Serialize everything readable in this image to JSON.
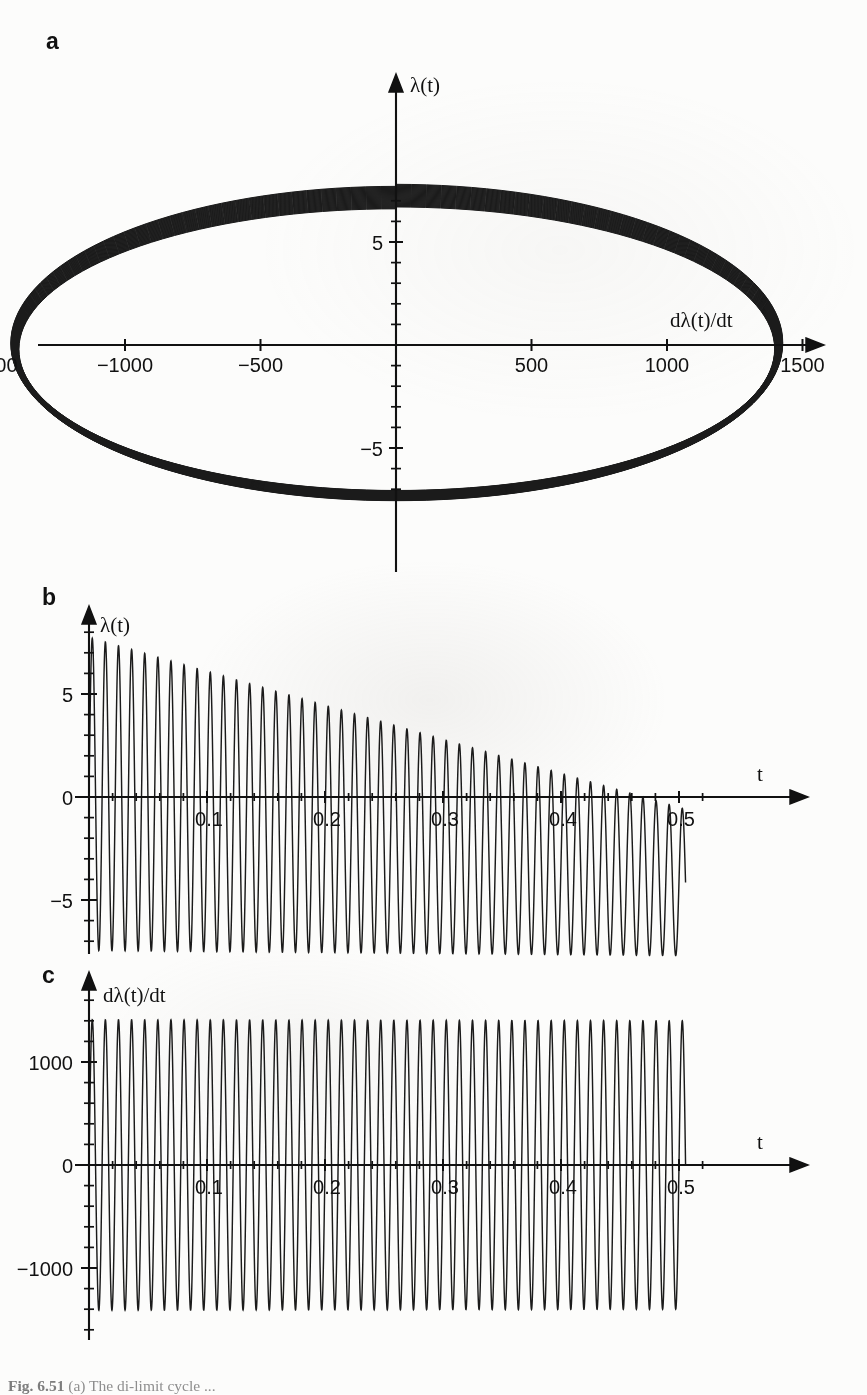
{
  "figure": {
    "caption_prefix": "Fig. 6.51",
    "caption_text": "(a) The di-limit cycle ..."
  },
  "panels": {
    "a": {
      "letter": "a",
      "yaxis_label": "λ(t)",
      "xaxis_label": "dλ(t)/dt",
      "x_ticklabels": [
        "−1500",
        "−1000",
        "−500",
        "500",
        "1000",
        "1500"
      ],
      "x_tickvalues": [
        -1500,
        -1000,
        -500,
        500,
        1000,
        1500
      ],
      "y_ticklabels": [
        "5",
        "−5"
      ],
      "y_tickvalues": [
        5,
        -5
      ]
    },
    "b": {
      "letter": "b",
      "yaxis_label": "λ(t)",
      "xaxis_label": "t",
      "x_ticklabels": [
        "0.1",
        "0.2",
        "0.3",
        "0.4",
        "0.5"
      ],
      "x_tickvalues": [
        0.1,
        0.2,
        0.3,
        0.4,
        0.5
      ],
      "y_ticklabels": [
        "5",
        "0",
        "−5"
      ],
      "y_tickvalues": [
        5,
        0,
        -5
      ]
    },
    "c": {
      "letter": "c",
      "yaxis_label": "dλ(t)/dt",
      "xaxis_label": "t",
      "x_ticklabels": [
        "0.1",
        "0.2",
        "0.3",
        "0.4",
        "0.5"
      ],
      "x_tickvalues": [
        0.1,
        0.2,
        0.3,
        0.4,
        0.5
      ],
      "y_ticklabels": [
        "1000",
        "0",
        "−1000"
      ],
      "y_tickvalues": [
        1000,
        0,
        -1000
      ]
    }
  },
  "chart_data": [
    {
      "id": "panel-a",
      "type": "line",
      "title": "",
      "subtitle": "phase portrait of dλ(t)/dt versus λ(t)",
      "xlabel": "dλ(t)/dt",
      "ylabel": "λ(t)",
      "xlim": [
        -1700,
        1700
      ],
      "ylim": [
        -8.2,
        8.2
      ],
      "xticks": [
        -1500,
        -1000,
        -500,
        500,
        1000,
        1500
      ],
      "yticks": [
        -5,
        5
      ],
      "yminor_ticks": [
        -7,
        -6,
        -4,
        -3,
        -2,
        -1,
        1,
        2,
        3,
        4,
        6,
        7
      ],
      "grid": false,
      "legend": null,
      "description": "Family of nested closed orbits (slowly shrinking spiral) traced over 0 ≤ t ≤ 0.5, producing a cylinder-like envelope. Lambda amplitude decays from about 7.7 to 7.3 while the mean drifts downward, so the loops sweep from the top of the figure to the bottom.",
      "orbit_count": 45,
      "envelope": {
        "x_amplitude_start": 1430,
        "x_amplitude_end": 1400,
        "y_amplitude_start": 7.7,
        "y_amplitude_end": 6.9,
        "y_center_start": 0.1,
        "y_center_end": -0.2
      }
    },
    {
      "id": "panel-b",
      "type": "line",
      "title": "",
      "subtitle": "λ(t) versus time",
      "xlabel": "t",
      "ylabel": "λ(t)",
      "xlim": [
        0,
        0.555
      ],
      "ylim": [
        -8.6,
        8.4
      ],
      "xticks": [
        0.1,
        0.2,
        0.3,
        0.4,
        0.5
      ],
      "xminor_step": 0.02,
      "yticks": [
        -5,
        0,
        5
      ],
      "yminor_step": 1,
      "grid": false,
      "legend": null,
      "series": [
        {
          "name": "λ(t)",
          "model": "damped_drift_sine",
          "amplitude_start": 7.6,
          "amplitude_end": 3.6,
          "center_start": 0.15,
          "center_end": -4.1,
          "frequency_hz": 90,
          "phase_deg": 0,
          "n_cycles": 45
        }
      ],
      "description": "Oscillation at about 90 Hz whose peak amplitude decays from roughly 7.7 at t=0 to about 0 at t=0.5, while the waveform mean drifts from 0 down to roughly -4; the negative troughs therefore reach about -7.7 at t=0.5."
    },
    {
      "id": "panel-c",
      "type": "line",
      "title": "",
      "subtitle": "dλ(t)/dt versus time",
      "xlabel": "t",
      "ylabel": "dλ(t)/dt",
      "xlim": [
        0,
        0.555
      ],
      "ylim": [
        -1650,
        1620
      ],
      "xticks": [
        0.1,
        0.2,
        0.3,
        0.4,
        0.5
      ],
      "xminor_step": 0.02,
      "yticks": [
        -1000,
        0,
        1000
      ],
      "yminor_step": 200,
      "grid": false,
      "legend": null,
      "series": [
        {
          "name": "dλ(t)/dt",
          "model": "near_constant_sine",
          "amplitude_start": 1410,
          "amplitude_end": 1400,
          "center": 0,
          "frequency_hz": 90,
          "phase_deg": 0,
          "n_cycles": 45
        }
      ],
      "description": "Essentially constant-amplitude oscillation of about ±1400 at 90 Hz across the whole interval 0 to 0.5 s."
    }
  ],
  "colors": {
    "ink": "#1b1b1b",
    "axis": "#111111",
    "paper": "#fcfcfb",
    "caption": "#8e8e8e"
  }
}
